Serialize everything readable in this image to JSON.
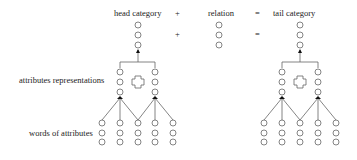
{
  "labels": {
    "head": "head category",
    "plus": "+",
    "relation": "relation",
    "equals": "=",
    "tail": "tail category",
    "attr_repr": "attributes representations",
    "words": "words of attributes"
  },
  "colors": {
    "stroke": "#555555",
    "arrow": "#111111",
    "text": "#222222"
  }
}
